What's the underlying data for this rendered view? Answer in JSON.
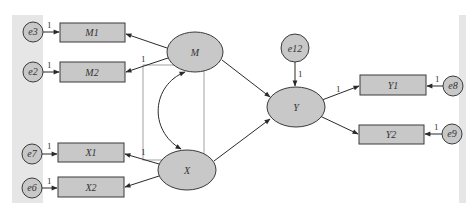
{
  "diagram": {
    "type": "structural-equation-model",
    "colors": {
      "node_fill": "#c8c8c8",
      "node_stroke": "#3a3a3a",
      "strip": "#e6e6e6",
      "selection_box": "#8a8a8a"
    },
    "latent": {
      "M": "M",
      "X": "X",
      "Y": "Y"
    },
    "observed": {
      "M1": "M1",
      "M2": "M2",
      "X1": "X1",
      "X2": "X2",
      "Y1": "Y1",
      "Y2": "Y2"
    },
    "errors": {
      "e3": "e3",
      "e2": "e2",
      "e7": "e7",
      "e6": "e6",
      "e12": "e12",
      "e8": "e8",
      "e9": "e9"
    },
    "path_labels": {
      "e3_M1": "1",
      "e2_M2": "1",
      "e7_X1": "1",
      "e6_X2": "1",
      "e12_Y": "1",
      "e8_Y1": "1",
      "e9_Y2": "1",
      "M_M2": "1",
      "X_X1": "1",
      "Y_Y1": "1"
    },
    "edges": [
      {
        "from": "e3",
        "to": "M1"
      },
      {
        "from": "e2",
        "to": "M2"
      },
      {
        "from": "e7",
        "to": "X1"
      },
      {
        "from": "e6",
        "to": "X2"
      },
      {
        "from": "M",
        "to": "M1"
      },
      {
        "from": "M",
        "to": "M2"
      },
      {
        "from": "X",
        "to": "X1"
      },
      {
        "from": "X",
        "to": "X2"
      },
      {
        "from": "M",
        "to": "Y"
      },
      {
        "from": "X",
        "to": "Y"
      },
      {
        "from": "e12",
        "to": "Y"
      },
      {
        "from": "Y",
        "to": "Y1"
      },
      {
        "from": "Y",
        "to": "Y2"
      },
      {
        "from": "e8",
        "to": "Y1"
      },
      {
        "from": "e9",
        "to": "Y2"
      },
      {
        "from": "M",
        "to": "X",
        "type": "covariance"
      }
    ]
  }
}
